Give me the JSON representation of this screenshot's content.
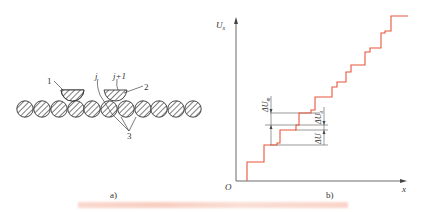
{
  "figure_a": {
    "sublabel": "a)",
    "callouts": {
      "wiper_1": "1",
      "wiper_j": "j",
      "wiper_j1": "j+1",
      "brush_2": "2",
      "turns_3": "3"
    },
    "turn_count": 11
  },
  "figure_b": {
    "sublabel": "b)",
    "y_axis_label": "U",
    "y_axis_subscript": "x",
    "x_axis_label": "x",
    "origin_label": "O",
    "annotations": {
      "delta_u_m": "ΔU",
      "delta_u_m_sub": "m",
      "delta_u_a": "ΔU",
      "delta_u_a_sub": "a",
      "delta_u": "ΔU"
    },
    "line_color": "#e8553a"
  },
  "caption": {
    "text": ""
  }
}
